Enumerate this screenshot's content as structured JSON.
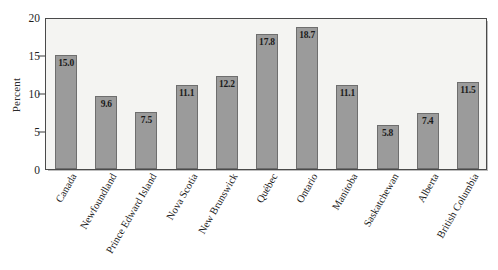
{
  "chart_data": {
    "type": "bar",
    "title": "",
    "subtitle": "",
    "xlabel": "",
    "ylabel": "Percent",
    "ylim": [
      0,
      20
    ],
    "yticks": [
      0,
      5,
      10,
      15,
      20
    ],
    "ytick_labels": [
      "0",
      "5",
      "10",
      "15",
      "20"
    ],
    "grid": false,
    "legend": null,
    "bar_color": "#9b9b9b",
    "bar_edge_color": "#6e6e6e",
    "plot_background": "#f4f4f2",
    "axis_color": "#4a4a4a",
    "value_labels_shown": true,
    "categories": [
      "Canada",
      "Newfoundland",
      "Prince Edward Island",
      "Nova Scotia",
      "New Brunswick",
      "Québec",
      "Ontario",
      "Manitoba",
      "Saskatchewan",
      "Alberta",
      "British Columbia"
    ],
    "values": [
      15.0,
      9.6,
      7.5,
      11.1,
      12.2,
      17.8,
      18.7,
      11.1,
      5.8,
      7.4,
      11.5
    ],
    "value_labels": [
      "15.0",
      "9.6",
      "7.5",
      "11.1",
      "12.2",
      "17.8",
      "18.7",
      "11.1",
      "5.8",
      "7.4",
      "11.5"
    ]
  }
}
